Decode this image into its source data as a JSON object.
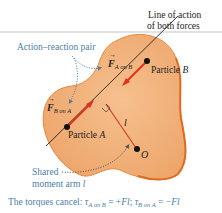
{
  "figure": {
    "labels": {
      "line_of_action_1": "Line of action",
      "line_of_action_2": "of both forces",
      "action_reaction": "Action–reaction pair",
      "force_a_on_b_symbol": "F",
      "force_a_on_b_sub": "A on B",
      "force_b_on_a_symbol": "F",
      "force_b_on_a_sub": "B on A",
      "particle_b": "Particle ",
      "particle_b_letter": "B",
      "particle_a": "Particle ",
      "particle_a_letter": "A",
      "moment_arm_symbol": "l",
      "origin": "O",
      "shared_1": "Shared",
      "shared_2": "moment arm ",
      "shared_2_symbol": "l"
    },
    "caption": {
      "prefix": "The torques cancel: ",
      "tau1": "τ",
      "tau1_sub": "A on B",
      "eq1": " = +",
      "eq1_val": "Fl",
      "sep": "; ",
      "tau2": "τ",
      "tau2_sub": "B on A",
      "eq2": " = −",
      "eq2_val": "Fl"
    },
    "colors": {
      "body_fill": "#f2b27a",
      "body_edge": "#e06a1e",
      "force_arrow": "#e0301e",
      "annotation_blue": "#4a7fa8",
      "text": "#222222",
      "top_rule": "#d9d9d9"
    }
  }
}
